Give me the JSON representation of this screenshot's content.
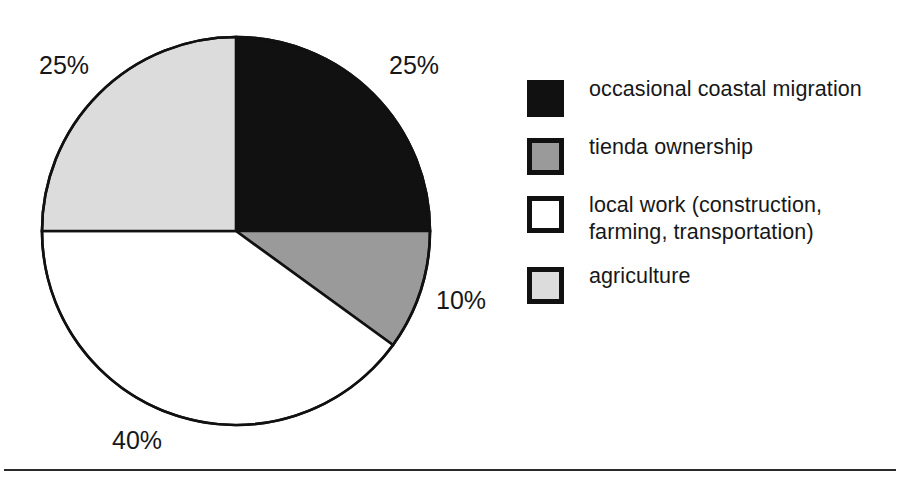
{
  "chart_data": {
    "type": "pie",
    "title": "",
    "subtitle": "",
    "xlabel": "",
    "ylabel": "",
    "legend_position": "right",
    "grid": false,
    "start_angle_deg": 0,
    "direction": "clockwise",
    "center": {
      "x": 236,
      "y": 231
    },
    "radius": 194,
    "categories": [
      "occasional coastal migration",
      "tienda ownership",
      "local work (construction, farming, transportation)",
      "agriculture"
    ],
    "values": [
      25,
      10,
      40,
      25
    ],
    "value_labels": [
      "25%",
      "10%",
      "40%",
      "25%"
    ],
    "colors": [
      "#111111",
      "#9a9a9a",
      "#ffffff",
      "#dcdcdc"
    ],
    "slices": [
      {
        "label": "occasional coastal migration",
        "value": 25,
        "value_label": "25%",
        "color": "#111111",
        "start_deg": 0,
        "end_deg": 90
      },
      {
        "label": "tienda ownership",
        "value": 10,
        "value_label": "10%",
        "color": "#9a9a9a",
        "start_deg": 90,
        "end_deg": 126
      },
      {
        "label": "local work (construction, farming, transportation)",
        "value": 40,
        "value_label": "40%",
        "color": "#ffffff",
        "start_deg": 126,
        "end_deg": 270
      },
      {
        "label": "agriculture",
        "value": 25,
        "value_label": "25%",
        "color": "#dcdcdc",
        "start_deg": 270,
        "end_deg": 360
      }
    ]
  },
  "pie": {
    "outline_color": "#111111",
    "labels": {
      "migration_pct": "25%",
      "tienda_pct": "10%",
      "localwork_pct": "40%",
      "agriculture_pct": "25%"
    }
  },
  "legend": {
    "items": [
      {
        "label": "occasional coastal migration",
        "swatch_fill": "#111111",
        "swatch_border": "#111111",
        "swatch_name": "legend-swatch-black"
      },
      {
        "label": "tienda ownership",
        "swatch_fill": "#9a9a9a",
        "swatch_border": "#111111",
        "swatch_name": "legend-swatch-gray"
      },
      {
        "label": "local work (construction, farming, transportation)",
        "swatch_fill": "#ffffff",
        "swatch_border": "#111111",
        "swatch_name": "legend-swatch-white"
      },
      {
        "label": "agriculture",
        "swatch_fill": "#dcdcdc",
        "swatch_border": "#111111",
        "swatch_name": "legend-swatch-lightgray"
      }
    ]
  },
  "footer": {
    "rule_color": "#2a2a2a"
  }
}
